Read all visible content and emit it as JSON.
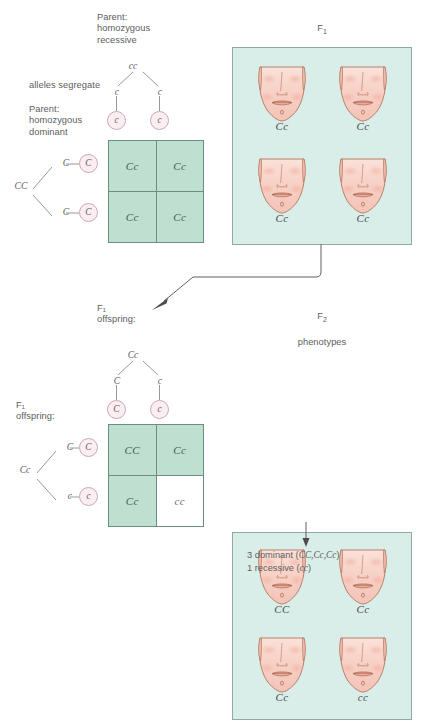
{
  "diagram": {
    "title_top_left": "Parent:\nhomozygous\nrecessive",
    "segregate_note": "alleles segregate",
    "title_bottom_left": "Parent:\nhomozygous\ndominant",
    "f1_offspring_top": "F₁\noffspring:",
    "f1_offspring_left": "F₁\noffspring:",
    "f1_panel_title_line1": "F",
    "f1_panel_title_sub": "1",
    "f1_panel_title_line2": "phenotypes",
    "f2_panel_title_line1": "F",
    "f2_panel_title_sub": "2",
    "f2_panel_title_line2": "phenotypes"
  },
  "cross1": {
    "top_parent_genotype": "cc",
    "top_branch_left": "c",
    "top_branch_right": "c",
    "top_gamete_left": "c",
    "top_gamete_right": "c",
    "left_parent_genotype": "CC",
    "left_branch_top": "C",
    "left_branch_bottom": "C",
    "left_gamete_top": "C",
    "left_gamete_bottom": "C",
    "cells": [
      "Cc",
      "Cc",
      "Cc",
      "Cc"
    ],
    "cell_shaded": [
      true,
      true,
      true,
      true
    ]
  },
  "cross2": {
    "top_parent_genotype": "Cc",
    "top_branch_left": "C",
    "top_branch_right": "c",
    "top_gamete_left": "C",
    "top_gamete_right": "c",
    "left_parent_genotype": "Cc",
    "left_branch_top": "C",
    "left_branch_bottom": "c",
    "left_gamete_top": "C",
    "left_gamete_bottom": "c",
    "cells": [
      "CC",
      "Cc",
      "Cc",
      "cc"
    ],
    "cell_shaded": [
      true,
      true,
      true,
      false
    ]
  },
  "f1_panel": {
    "faces": [
      {
        "label": "Cc"
      },
      {
        "label": "Cc"
      },
      {
        "label": "Cc"
      },
      {
        "label": "Cc"
      }
    ]
  },
  "f2_panel": {
    "faces": [
      {
        "label": "CC"
      },
      {
        "label": "Cc"
      },
      {
        "label": "Cc"
      },
      {
        "label": "cc"
      }
    ]
  },
  "ratio": {
    "line1_prefix": "3 dominant (",
    "line1_genotypes": "CC,Cc,Cc",
    "line1_suffix": ")",
    "line2_prefix": "1 recessive (",
    "line2_genotypes": "cc",
    "line2_suffix": ")"
  },
  "colors": {
    "panel_bg": "#d9eee8",
    "cell_green": "#bfdfd0",
    "cell_white": "#ffffff",
    "grid_line": "#6d8d83",
    "gamete_fill": "#fbeef1",
    "skin": "#f6cfc4",
    "text": "#5d5e60"
  }
}
